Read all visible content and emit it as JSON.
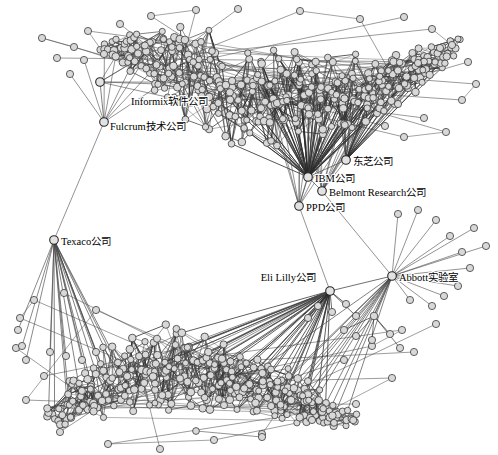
{
  "figure": {
    "type": "network-graph",
    "background": "#ffffff",
    "node_fill": "#d8d8d8",
    "node_stroke": "#3a3a3a",
    "edge_color": "#4a4a4a",
    "width": 498,
    "height": 455
  },
  "labeled_nodes": [
    {
      "id": "informix",
      "label": "Informix软件公司",
      "x": 100,
      "y": 82,
      "lx": 131,
      "ly": 105,
      "anchor": "start",
      "hub": true
    },
    {
      "id": "fulcrum",
      "label": "Fulcrum技术公司",
      "x": 104,
      "y": 122,
      "lx": 110,
      "ly": 130,
      "anchor": "start",
      "hub": true
    },
    {
      "id": "toshiba",
      "label": "东芝公司",
      "x": 346,
      "y": 160,
      "lx": 353,
      "ly": 165,
      "anchor": "start",
      "hub": true
    },
    {
      "id": "ibm",
      "label": "IBM公司",
      "x": 308,
      "y": 177,
      "lx": 315,
      "ly": 182,
      "anchor": "start",
      "hub": true
    },
    {
      "id": "belmont",
      "label": "Belmont Research公司",
      "x": 322,
      "y": 191,
      "lx": 329,
      "ly": 196,
      "anchor": "start",
      "hub": true
    },
    {
      "id": "ppd",
      "label": "PPD公司",
      "x": 299,
      "y": 206,
      "lx": 306,
      "ly": 211,
      "anchor": "start",
      "hub": true
    },
    {
      "id": "elililly",
      "label": "Eli Lilly公司",
      "x": 330,
      "y": 291,
      "lx": 316,
      "ly": 281,
      "anchor": "end",
      "hub": true
    },
    {
      "id": "abbott",
      "label": "Abbott实验室",
      "x": 392,
      "y": 276,
      "lx": 399,
      "ly": 281,
      "anchor": "start",
      "hub": true
    },
    {
      "id": "texaco",
      "label": "Texaco公司",
      "x": 54,
      "y": 240,
      "lx": 61,
      "ly": 245,
      "anchor": "start",
      "hub": true
    }
  ],
  "chart_data": {
    "type": "scatter",
    "title": "",
    "node_count_approx": 620,
    "clusters": [
      {
        "name": "upper-crescent",
        "approx_nodes": 300,
        "center_x": 265,
        "center_y": 60
      },
      {
        "name": "lower-crescent",
        "approx_nodes": 250,
        "center_x": 215,
        "center_y": 385
      }
    ],
    "bridge_labels": [
      "Informix软件公司",
      "Fulcrum技术公司",
      "东芝公司",
      "IBM公司",
      "Belmont Research公司",
      "PPD公司",
      "Eli Lilly公司",
      "Abbott实验室",
      "Texaco公司"
    ],
    "xlabel": "",
    "ylabel": "",
    "grid": false,
    "legend": "none"
  }
}
